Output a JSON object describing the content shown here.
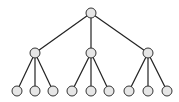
{
  "diagram": {
    "type": "tree",
    "colors": {
      "edge": "#222222",
      "node_fill": "#e6e6e6",
      "node_stroke": "#333333",
      "background": "#ffffff"
    },
    "node_radius": 5,
    "nodes": [
      {
        "id": "root",
        "x": 91,
        "y": 13
      },
      {
        "id": "c1",
        "x": 35,
        "y": 53
      },
      {
        "id": "c2",
        "x": 91,
        "y": 53
      },
      {
        "id": "c3",
        "x": 148,
        "y": 53
      },
      {
        "id": "l1",
        "x": 17,
        "y": 91
      },
      {
        "id": "l2",
        "x": 35,
        "y": 91
      },
      {
        "id": "l3",
        "x": 53,
        "y": 91
      },
      {
        "id": "l4",
        "x": 72,
        "y": 91
      },
      {
        "id": "l5",
        "x": 91,
        "y": 91
      },
      {
        "id": "l6",
        "x": 109,
        "y": 91
      },
      {
        "id": "l7",
        "x": 129,
        "y": 91
      },
      {
        "id": "l8",
        "x": 148,
        "y": 91
      },
      {
        "id": "l9",
        "x": 167,
        "y": 91
      }
    ],
    "edges": [
      [
        "root",
        "c1"
      ],
      [
        "root",
        "c2"
      ],
      [
        "root",
        "c3"
      ],
      [
        "c1",
        "l1"
      ],
      [
        "c1",
        "l2"
      ],
      [
        "c1",
        "l3"
      ],
      [
        "c2",
        "l4"
      ],
      [
        "c2",
        "l5"
      ],
      [
        "c2",
        "l6"
      ],
      [
        "c3",
        "l7"
      ],
      [
        "c3",
        "l8"
      ],
      [
        "c3",
        "l9"
      ]
    ]
  }
}
